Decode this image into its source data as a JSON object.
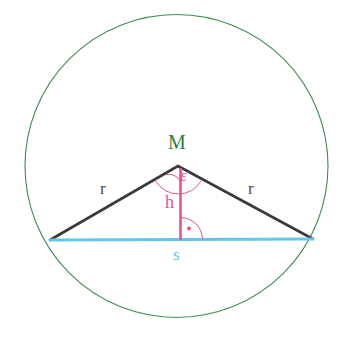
{
  "figure": {
    "width": 348,
    "height": 339,
    "background_color": "#ffffff"
  },
  "colors": {
    "circle_stroke": "#3f8c4f",
    "triangle_stroke": "#3a3a3a",
    "chord_stroke": "#63c8e8",
    "height_stroke": "#e2558f",
    "angle_arc_stroke": "#e2558f",
    "right_angle_stroke": "#e2558f",
    "label_M": "#2f7d3a",
    "label_r": "#4a4a4a",
    "label_h": "#e2558f",
    "label_s": "#63c8e8",
    "label_epsilon": "#e2558f"
  },
  "geometry": {
    "circle": {
      "name": "circumscribed-circle",
      "cx": 176.5,
      "cy": 166.0,
      "r": 151.5,
      "stroke_width": 1.1
    },
    "apex": {
      "name": "M",
      "x": 178.0,
      "y": 166.0
    },
    "chord_left": {
      "name": "A",
      "x": 50.0,
      "y": 240.0
    },
    "chord_right": {
      "name": "B",
      "x": 313.0,
      "y": 239.0
    },
    "foot": {
      "name": "H",
      "x": 181.0,
      "y": 239.5
    },
    "radius_left": {
      "name": "r-left",
      "stroke_width": 2.6
    },
    "radius_right": {
      "name": "r-right",
      "stroke_width": 2.6
    },
    "chord": {
      "name": "s",
      "stroke_width": 2.8
    },
    "height": {
      "name": "h",
      "stroke_width": 2.6
    },
    "angle_arc_small": {
      "name": "epsilon-half-arc",
      "radius": 15,
      "stroke_width": 1.0
    },
    "angle_arc_large": {
      "name": "epsilon-full-arc",
      "radius": 26,
      "stroke_width": 1.0
    },
    "right_angle_arc": {
      "name": "right-angle-arc",
      "radius": 22,
      "stroke_width": 1.0
    },
    "right_angle_dot": {
      "name": "right-angle-dot",
      "cx": 189,
      "cy": 227,
      "r": 1.8
    }
  },
  "labels": {
    "apex": "M",
    "radius_left": "r",
    "radius_right": "r",
    "height": "h",
    "chord": "s",
    "angle": "ε"
  }
}
